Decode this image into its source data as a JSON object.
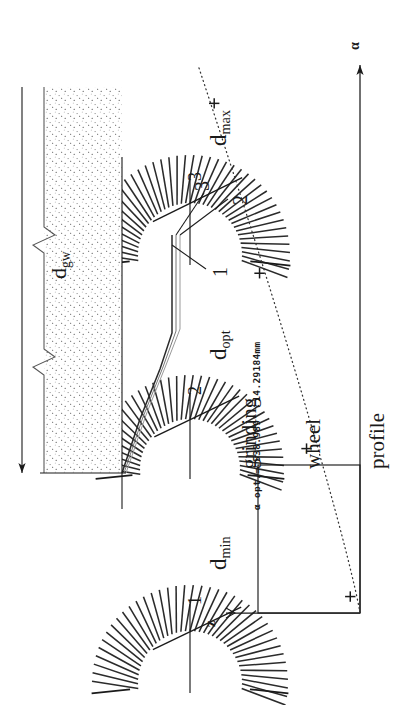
{
  "figure": {
    "type": "technical-diagram",
    "orientation": "landscape-rotated-90ccw",
    "background": "#ffffff",
    "ink": "#1a1a1a"
  },
  "labels": {
    "d_min": {
      "base": "d",
      "sub": "min",
      "index": "1"
    },
    "d_opt": {
      "base": "d",
      "sub": "opt",
      "index": "2"
    },
    "d_max": {
      "base": "d",
      "sub": "max",
      "index": "3"
    },
    "d_gw": {
      "base": "d",
      "sub": "gw"
    },
    "axis_z": "z",
    "axis_alpha": "α",
    "profile_caption_line1": "grinding",
    "profile_caption_line2": "wheel",
    "profile_caption_line3": "profile",
    "callout_1": "1",
    "callout_2": "2",
    "callout_3": "3"
  },
  "annotation": {
    "alpha_symbol": "α",
    "text": "α opt.= 538.989°  14.29184mm",
    "prefix": "α opt.=",
    "angle_value": "538.989",
    "angle_unit": "°",
    "length_value": "14.29184",
    "length_unit": "mm"
  },
  "chart_data": {
    "type": "scatter",
    "title": "",
    "xlabel": "α",
    "ylabel": "z",
    "grid": false,
    "legend": null,
    "axis_z_direction": "left-arrow",
    "axis_alpha_direction": "right-arrow",
    "x": [
      0.03,
      0.3,
      0.62,
      0.93
    ],
    "y": [
      0.06,
      0.33,
      0.62,
      0.9
    ],
    "marker": "+",
    "curve_style": "dotted",
    "series": [
      {
        "name": "d(α)",
        "points": [
          {
            "x": 0.03,
            "y": 0.06
          },
          {
            "x": 0.3,
            "y": 0.33
          },
          {
            "x": 0.62,
            "y": 0.62
          },
          {
            "x": 0.93,
            "y": 0.9
          }
        ]
      }
    ],
    "reference_box": {
      "x0": 0.03,
      "y0": 0.0,
      "x1": 0.62,
      "y1": 0.62
    }
  },
  "fans": [
    {
      "name": "fan-d-min",
      "index": "1",
      "label": "d_min"
    },
    {
      "name": "fan-d-opt",
      "index": "2",
      "label": "d_opt"
    },
    {
      "name": "fan-d-max",
      "index": "3",
      "label": "d_max"
    }
  ]
}
